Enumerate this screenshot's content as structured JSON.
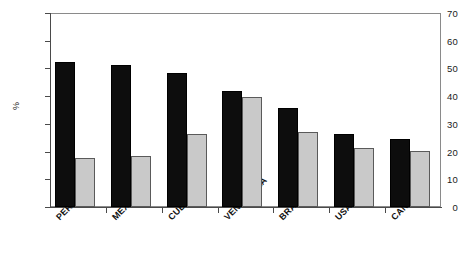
{
  "chart_data": {
    "type": "bar",
    "title": "",
    "subtitle": "",
    "xlabel": "",
    "ylabel": "%",
    "ylim": [
      0,
      70
    ],
    "ytick_step": 10,
    "yticks": [
      0,
      10,
      20,
      30,
      40,
      50,
      60,
      70
    ],
    "grid": false,
    "legend": "none",
    "legend_entries": [],
    "categories": [
      "PERU",
      "MEXICO",
      "CUBA",
      "VENEZUELA",
      "BRAZIL",
      "USA",
      "CANADA"
    ],
    "series": [
      {
        "name": "Series 1",
        "color": "#0d0d0d",
        "values": [
          52.3,
          51.2,
          48.3,
          42.0,
          35.7,
          26.2,
          24.7
        ]
      },
      {
        "name": "Series 2",
        "color": "#c9c9c9",
        "values": [
          17.8,
          18.5,
          26.5,
          39.8,
          27.2,
          21.4,
          20.3
        ]
      }
    ]
  },
  "axis": {
    "y_title": "%",
    "y_tick_labels": [
      "0",
      "10",
      "20",
      "30",
      "40",
      "50",
      "60",
      "70"
    ]
  }
}
